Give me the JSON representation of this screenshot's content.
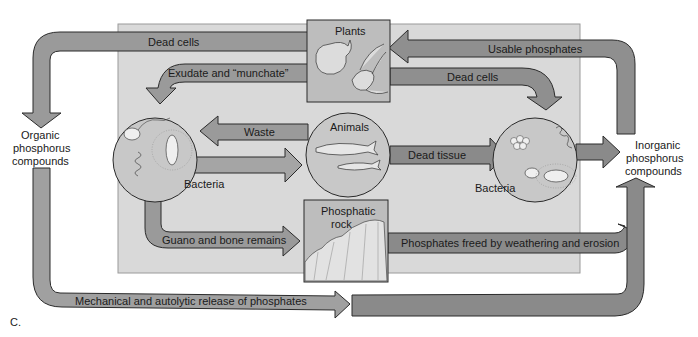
{
  "diagram": {
    "figure_label": "C.",
    "colors": {
      "background": "#ffffff",
      "panel": "#d9d9d9",
      "arrow_fill": "#9a9a9a",
      "arrow_dark_fill": "#8a8a8a",
      "node_fill": "#bdbdbd",
      "circle_fill": "#c8c8c8",
      "outline": "#2a2a2a"
    },
    "side_nodes": {
      "organic": [
        "Organic",
        "phosphorus",
        "compounds"
      ],
      "inorganic": [
        "Inorganic",
        "phosphorus",
        "compounds"
      ]
    },
    "nodes": {
      "plants": "Plants",
      "animals": "Animals",
      "bacteria_left": "Bacteria",
      "bacteria_right": "Bacteria",
      "phosphatic_rock": [
        "Phosphatic",
        "rock"
      ]
    },
    "arrows": {
      "dead_cells_plants_to_organic": "Dead cells",
      "exudate": "Exudate and “munchate”",
      "usable_phosphates": "Usable phosphates",
      "dead_cells_plants_to_bacteria": "Dead cells",
      "waste": "Waste",
      "dead_tissue": "Dead tissue",
      "guano": "Guano and bone remains",
      "weathering": "Phosphates freed by weathering and erosion",
      "mechanical_release": "Mechanical and autolytic release of phosphates"
    }
  }
}
